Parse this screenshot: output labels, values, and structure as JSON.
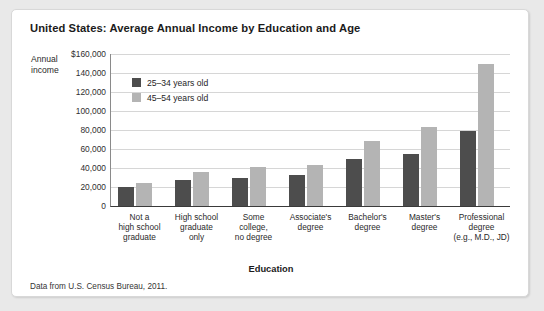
{
  "figure": {
    "title": "United States: Average Annual Income by Education and Age",
    "source_note": "Data from U.S. Census Bureau, 2011.",
    "y_axis_title": "Annual income",
    "x_axis_title": "Education"
  },
  "colors": {
    "series_25_34": "#4d4d4d",
    "series_45_54": "#b4b4b4",
    "gridline": "#d6d6d6",
    "axis": "#3a3a3a",
    "card_background": "#ffffff",
    "page_background": "#e9e9e9"
  },
  "chart_data": {
    "type": "bar",
    "title": "United States: Average Annual Income by Education and Age",
    "xlabel": "Education",
    "ylabel": "Annual income",
    "ylim": [
      0,
      160000
    ],
    "grid": true,
    "legend_position": "top-left-inside",
    "ytick_labels": [
      "$160,000",
      "140,000",
      "120,000",
      "100,000",
      "80,000",
      "60,000",
      "40,000",
      "20,000",
      "0"
    ],
    "ytick_values": [
      160000,
      140000,
      120000,
      100000,
      80000,
      60000,
      40000,
      20000,
      0
    ],
    "categories": [
      "Not a high school graduate",
      "High school graduate only",
      "Some college, no degree",
      "Associate's degree",
      "Bachelor's degree",
      "Master's degree",
      "Professional degree (e.g., M.D., JD)"
    ],
    "category_lines": [
      [
        "Not a",
        "high school",
        "graduate"
      ],
      [
        "High school",
        "graduate",
        "only"
      ],
      [
        "Some",
        "college,",
        "no degree"
      ],
      [
        "Associate's",
        "degree"
      ],
      [
        "Bachelor's",
        "degree"
      ],
      [
        "Master's",
        "degree"
      ],
      [
        "Professional",
        "degree",
        "(e.g., M.D., JD)"
      ]
    ],
    "series": [
      {
        "name": "25–34 years old",
        "color": "#4d4d4d",
        "values": [
          20000,
          27000,
          30000,
          33000,
          49000,
          55000,
          79000
        ]
      },
      {
        "name": "45–54 years old",
        "color": "#b4b4b4",
        "values": [
          24000,
          36000,
          41000,
          43000,
          68000,
          83000,
          150000
        ]
      }
    ]
  }
}
